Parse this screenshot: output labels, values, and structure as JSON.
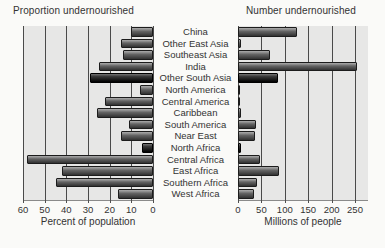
{
  "titles": {
    "left": "Proportion undernourished",
    "right": "Number undernourished"
  },
  "axes": {
    "left_label": "Percent of population",
    "right_label": "Millions of people",
    "left_ticks": [
      "60",
      "50",
      "40",
      "30",
      "20",
      "10",
      "0"
    ],
    "right_ticks": [
      "0",
      "50",
      "100",
      "150",
      "200",
      "250"
    ]
  },
  "colors": {
    "page_bg": "#fafaf8",
    "plot_bg": "#e7e7e6",
    "gridline": "#4a4a4a",
    "text": "#333333",
    "bar_body": "#5e5e5e",
    "bar_emphasis": "#1d1d1d"
  },
  "chart_data": {
    "type": "bar",
    "orientation": "horizontal",
    "layout": "back-to-back",
    "grid": true,
    "categories": [
      "China",
      "Other East Asia",
      "Southeast Asia",
      "India",
      "Other South Asia",
      "North America",
      "Central America",
      "Caribbean",
      "South America",
      "Near East",
      "North Africa",
      "Central Africa",
      "East Africa",
      "Southern Africa",
      "West Africa"
    ],
    "series": [
      {
        "name": "Proportion undernourished",
        "axis_title": "Percent of population",
        "unit": "percent",
        "xlim": [
          60,
          0
        ],
        "tick_step": 10,
        "values": [
          10,
          15,
          14,
          25,
          29,
          6,
          22,
          26,
          11,
          15,
          5,
          58,
          42,
          45,
          16
        ]
      },
      {
        "name": "Number undernourished",
        "axis_title": "Millions of people",
        "unit": "millions of people",
        "xlim": [
          0,
          250
        ],
        "tick_step": 50,
        "values": [
          125,
          7,
          68,
          255,
          85,
          4,
          5,
          7,
          38,
          36,
          7,
          46,
          88,
          40,
          34
        ]
      }
    ],
    "emphasized_categories": [
      "Other South Asia",
      "North Africa"
    ]
  }
}
